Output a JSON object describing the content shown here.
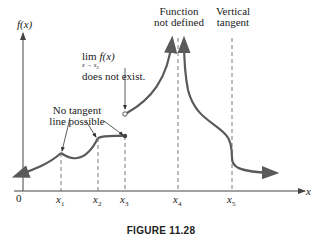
{
  "figure": {
    "caption": "FIGURE 11.28",
    "y_axis_label": "f(x)",
    "x_axis_label": "x",
    "origin_label": "0",
    "tick_labels": [
      "x1",
      "x2",
      "x3",
      "x4",
      "x5"
    ],
    "tick_display": {
      "x1": {
        "base": "x",
        "sub": "1"
      },
      "x2": {
        "base": "x",
        "sub": "2"
      },
      "x3": {
        "base": "x",
        "sub": "3"
      },
      "x4": {
        "base": "x",
        "sub": "4"
      },
      "x5": {
        "base": "x",
        "sub": "5"
      }
    },
    "annotations": {
      "no_tangent_line1": "No tangent",
      "no_tangent_line2": "line possible",
      "limit_lim": "lim",
      "limit_fx": "f(x)",
      "limit_sub": "x → x",
      "limit_sub_index": "3",
      "limit_text": "does not exist.",
      "function_not_defined_line1": "Function",
      "function_not_defined_line2": "not defined",
      "vertical_tangent_line1": "Vertical",
      "vertical_tangent_line2": "tangent"
    },
    "colors": {
      "curve": "#5a5a5a",
      "axis": "#444444",
      "text": "#222222",
      "dashed": "#555555"
    }
  }
}
